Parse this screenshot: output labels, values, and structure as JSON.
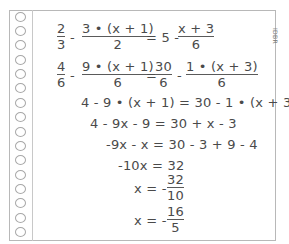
{
  "credit": "IDBR",
  "notebook": {
    "hole_count": 15,
    "holes_y": [
      12,
      26,
      40,
      55,
      69,
      83,
      98,
      112,
      127,
      141,
      155,
      170,
      184,
      198,
      213,
      227
    ]
  },
  "steps": {
    "line1": {
      "f1": {
        "num": "2",
        "den": "3"
      },
      "op1": "-",
      "f2": {
        "num": "3 • (x + 1)",
        "den": "2"
      },
      "rhs": "= 5 -",
      "f3": {
        "num": "x + 3",
        "den": "6"
      }
    },
    "line2": {
      "f1": {
        "num": "4",
        "den": "6"
      },
      "op1": "-",
      "f2": {
        "num": "9 • (x + 1)",
        "den": "6"
      },
      "eq": "=",
      "f3": {
        "num": "30",
        "den": "6"
      },
      "op2": "-",
      "f4": {
        "num": "1 • (x + 3)",
        "den": "6"
      }
    },
    "line3": "4 - 9 • (x + 1) = 30 - 1 • (x + 3)",
    "line4": "4 - 9x - 9 = 30 + x - 3",
    "line5": "-9x - x = 30 - 3 + 9 - 4",
    "line6": "-10x = 32",
    "line7": {
      "lhs": "x = -",
      "frac": {
        "num": "32",
        "den": "10"
      }
    },
    "line8": {
      "lhs": "x = -",
      "frac": {
        "num": "16",
        "den": "5"
      }
    }
  }
}
